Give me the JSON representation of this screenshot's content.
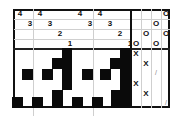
{
  "puzzle": {
    "type": "nonogram",
    "column_clues": [
      {
        "label": "4",
        "x": 15,
        "y": 9
      },
      {
        "label": "4",
        "x": 35,
        "y": 9
      },
      {
        "label": "4",
        "x": 75,
        "y": 9
      },
      {
        "label": "4",
        "x": 95,
        "y": 9
      },
      {
        "label": "3",
        "x": 25,
        "y": 19
      },
      {
        "label": "3",
        "x": 45,
        "y": 19
      },
      {
        "label": "3",
        "x": 85,
        "y": 19
      },
      {
        "label": "3",
        "x": 105,
        "y": 19
      },
      {
        "label": "2",
        "x": 55,
        "y": 29
      },
      {
        "label": "2",
        "x": 115,
        "y": 29
      },
      {
        "label": "1",
        "x": 65,
        "y": 39
      },
      {
        "label": "1",
        "x": 125,
        "y": 39
      }
    ],
    "o_marks": [
      {
        "label": "O",
        "x": 161,
        "y": 9
      },
      {
        "label": "O",
        "x": 151,
        "y": 19
      },
      {
        "label": "O",
        "x": 141,
        "y": 29
      },
      {
        "label": "O",
        "x": 161,
        "y": 29
      },
      {
        "label": "O",
        "x": 131,
        "y": 39
      },
      {
        "label": "O",
        "x": 151,
        "y": 39
      }
    ],
    "x_marks": [
      {
        "label": "X",
        "x": 131,
        "y": 49
      },
      {
        "label": "X",
        "x": 141,
        "y": 59
      },
      {
        "label": "X",
        "x": 131,
        "y": 79
      },
      {
        "label": "X",
        "x": 141,
        "y": 89
      }
    ],
    "slash_marks": [
      {
        "label": "/",
        "x": 151,
        "y": 68
      },
      {
        "label": "/",
        "x": 161,
        "y": 98
      }
    ],
    "filled_cells": [
      {
        "x": 62,
        "y": 48,
        "w": 10,
        "h": 11
      },
      {
        "x": 52,
        "y": 58,
        "w": 11,
        "h": 11
      },
      {
        "x": 22,
        "y": 69,
        "w": 11,
        "h": 11
      },
      {
        "x": 42,
        "y": 69,
        "w": 11,
        "h": 11
      },
      {
        "x": 62,
        "y": 58,
        "w": 10,
        "h": 32
      },
      {
        "x": 52,
        "y": 90,
        "w": 11,
        "h": 18
      },
      {
        "x": 12,
        "y": 97,
        "w": 11,
        "h": 11
      },
      {
        "x": 32,
        "y": 97,
        "w": 11,
        "h": 11
      },
      {
        "x": 120,
        "y": 48,
        "w": 10,
        "h": 11
      },
      {
        "x": 110,
        "y": 58,
        "w": 11,
        "h": 11
      },
      {
        "x": 82,
        "y": 69,
        "w": 11,
        "h": 11
      },
      {
        "x": 100,
        "y": 69,
        "w": 11,
        "h": 11
      },
      {
        "x": 120,
        "y": 58,
        "w": 10,
        "h": 50
      },
      {
        "x": 111,
        "y": 90,
        "w": 11,
        "h": 18
      },
      {
        "x": 72,
        "y": 97,
        "w": 11,
        "h": 11
      },
      {
        "x": 92,
        "y": 97,
        "w": 11,
        "h": 11
      }
    ]
  }
}
